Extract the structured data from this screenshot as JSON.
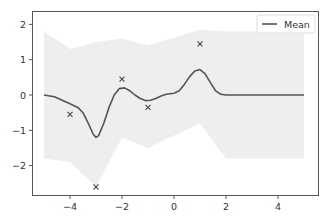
{
  "chart_data": {
    "type": "line",
    "title": "",
    "xlabel": "",
    "ylabel": "",
    "xlim": [
      -5.5,
      5.5
    ],
    "ylim": [
      -2.8,
      2.4
    ],
    "grid": false,
    "legend": {
      "position": "upper right",
      "entries": [
        "Mean"
      ]
    },
    "x_ticks": [
      -4,
      -2,
      0,
      2,
      4
    ],
    "x_tick_labels": [
      "−4",
      "−2",
      "0",
      "2",
      "4"
    ],
    "y_ticks": [
      2,
      1,
      0,
      -1,
      -2
    ],
    "y_tick_labels": [
      "2",
      "1",
      "0",
      "−1",
      "−2"
    ],
    "series": [
      {
        "name": "Mean",
        "kind": "line",
        "color": "#555555",
        "x": [
          -5.0,
          -4.6,
          -4.3,
          -4.0,
          -3.7,
          -3.5,
          -3.3,
          -3.1,
          -3.0,
          -2.9,
          -2.7,
          -2.5,
          -2.3,
          -2.1,
          -1.9,
          -1.7,
          -1.5,
          -1.3,
          -1.1,
          -0.9,
          -0.7,
          -0.5,
          -0.3,
          0.0,
          0.2,
          0.4,
          0.6,
          0.8,
          1.0,
          1.2,
          1.4,
          1.6,
          1.8,
          2.0,
          2.3,
          2.6,
          3.0,
          3.5,
          4.0,
          4.5,
          5.0
        ],
        "y": [
          0.0,
          -0.05,
          -0.15,
          -0.25,
          -0.35,
          -0.5,
          -0.8,
          -1.12,
          -1.2,
          -1.15,
          -0.8,
          -0.35,
          0.0,
          0.18,
          0.2,
          0.12,
          0.0,
          -0.1,
          -0.16,
          -0.15,
          -0.1,
          -0.03,
          0.02,
          0.05,
          0.12,
          0.3,
          0.52,
          0.68,
          0.72,
          0.6,
          0.35,
          0.12,
          0.02,
          0.0,
          0.0,
          0.0,
          0.0,
          0.0,
          0.0,
          0.0,
          0.0
        ]
      },
      {
        "name": "Observations",
        "kind": "scatter",
        "marker": "x",
        "color": "#444444",
        "x": [
          -4,
          -3,
          -2,
          -1,
          1
        ],
        "y": [
          -0.55,
          -2.6,
          0.45,
          -0.35,
          1.45
        ]
      },
      {
        "name": "Samples band",
        "kind": "area",
        "color": "#eeeeee",
        "x": [
          -5.0,
          -4.0,
          -3.0,
          -2.0,
          -1.0,
          1.0,
          2.0,
          5.0
        ],
        "upper": [
          1.8,
          1.3,
          1.5,
          1.6,
          1.4,
          1.85,
          1.8,
          1.8
        ],
        "lower": [
          -1.8,
          -1.9,
          -2.6,
          -1.2,
          -1.5,
          -0.8,
          -1.8,
          -1.8
        ]
      }
    ]
  }
}
